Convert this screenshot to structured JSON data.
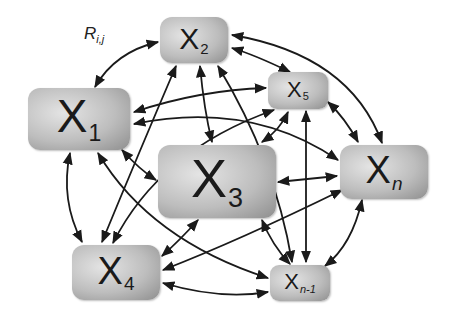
{
  "diagram": {
    "type": "fully-connected network of nodes with bidirectional arrows",
    "edge_label": {
      "main": "R",
      "sub": "i,j"
    },
    "nodes": [
      {
        "id": "x1",
        "main": "X",
        "sub": "1"
      },
      {
        "id": "x2",
        "main": "X",
        "sub": "2"
      },
      {
        "id": "x3",
        "main": "X",
        "sub": "3"
      },
      {
        "id": "x4",
        "main": "X",
        "sub": "4"
      },
      {
        "id": "x5",
        "main": "X",
        "sub": "5"
      },
      {
        "id": "xn",
        "main": "X",
        "sub": "n"
      },
      {
        "id": "xn1",
        "main": "X",
        "sub": "n-1"
      }
    ],
    "colors": {
      "node_light": "#e4e4e4",
      "node_dark": "#8e8e8e",
      "arrow": "#1a1a1a"
    }
  }
}
